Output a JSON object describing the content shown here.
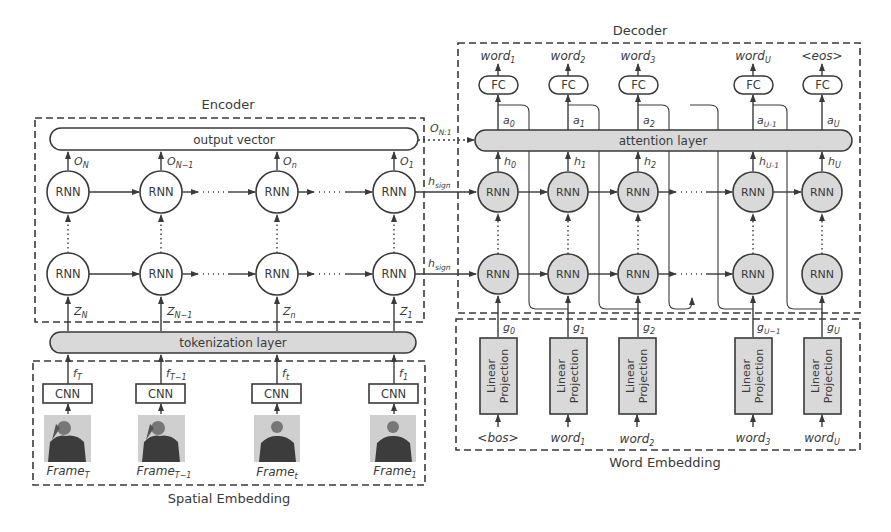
{
  "colors": {
    "stroke": "#3a3a3a",
    "fill_gray": "#d9d9d9",
    "background": "#ffffff",
    "frame_dark": "#3c3c3c",
    "frame_bg": "#cfcfcf"
  },
  "encoder": {
    "title": "Encoder",
    "output_vector": "output vector",
    "rnn_label": "RNN",
    "columns": [
      {
        "o": "O",
        "o_sub": "N",
        "z": "Z",
        "z_sub": "N"
      },
      {
        "o": "O",
        "o_sub": "N−1",
        "z": "Z",
        "z_sub": "N−1"
      },
      {
        "o": "O",
        "o_sub": "n",
        "z": "Z",
        "z_sub": "n"
      },
      {
        "o": "O",
        "o_sub": "1",
        "z": "Z",
        "z_sub": "1"
      }
    ],
    "tokenization_layer": "tokenization layer",
    "h_sign": "h",
    "h_sign_sub": "sign",
    "o_link": "O",
    "o_link_sub": "N:1"
  },
  "spatial_embedding": {
    "title": "Spatial Embedding",
    "cnn_label": "CNN",
    "columns": [
      {
        "f": "f",
        "f_sub": "T",
        "frame": "Frame",
        "frame_sub": "T"
      },
      {
        "f": "f",
        "f_sub": "T−1",
        "frame": "Frame",
        "frame_sub": "T−1"
      },
      {
        "f": "f",
        "f_sub": "t",
        "frame": "Frame",
        "frame_sub": "t"
      },
      {
        "f": "f",
        "f_sub": "1",
        "frame": "Frame",
        "frame_sub": "1"
      }
    ]
  },
  "decoder": {
    "title": "Decoder",
    "attention_layer": "attention layer",
    "fc_label": "FC",
    "rnn_label": "RNN",
    "columns": [
      {
        "out": "word",
        "out_sub": "1",
        "a": "a",
        "a_sub": "0",
        "h": "h",
        "h_sub": "0",
        "g": "g",
        "g_sub": "0"
      },
      {
        "out": "word",
        "out_sub": "2",
        "a": "a",
        "a_sub": "1",
        "h": "h",
        "h_sub": "1",
        "g": "g",
        "g_sub": "1"
      },
      {
        "out": "word",
        "out_sub": "3",
        "a": "a",
        "a_sub": "2",
        "h": "h",
        "h_sub": "2",
        "g": "g",
        "g_sub": "2"
      },
      {
        "out": "word",
        "out_sub": "U",
        "a": "a",
        "a_sub": "U-1",
        "h": "h",
        "h_sub": "U-1",
        "g": "g",
        "g_sub": "U−1"
      },
      {
        "out": "<eos>",
        "out_sub": "",
        "a": "a",
        "a_sub": "U",
        "h": "h",
        "h_sub": "U",
        "g": "g",
        "g_sub": "U"
      }
    ]
  },
  "word_embedding": {
    "title": "Word Embedding",
    "projection_line1": "Linear",
    "projection_line2": "Projection",
    "columns": [
      {
        "in": "<bos>",
        "in_sub": ""
      },
      {
        "in": "word",
        "in_sub": "1"
      },
      {
        "in": "word",
        "in_sub": "2"
      },
      {
        "in": "word",
        "in_sub": "3"
      },
      {
        "in": "word",
        "in_sub": "U"
      }
    ]
  }
}
